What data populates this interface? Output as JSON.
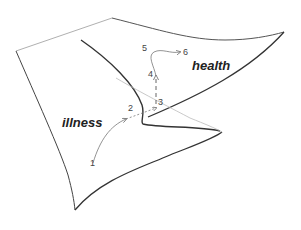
{
  "diagram": {
    "type": "cusp-catastrophe-surface",
    "regions": [
      {
        "id": "illness",
        "label": "illness",
        "x": 62,
        "y": 115
      },
      {
        "id": "health",
        "label": "health",
        "x": 192,
        "y": 58
      }
    ],
    "steps": [
      {
        "label": "1",
        "x": 90,
        "y": 158
      },
      {
        "label": "2",
        "x": 128,
        "y": 103
      },
      {
        "label": "3",
        "x": 157,
        "y": 96
      },
      {
        "label": "4",
        "x": 148,
        "y": 69
      },
      {
        "label": "5",
        "x": 143,
        "y": 43
      },
      {
        "label": "6",
        "x": 182,
        "y": 47
      }
    ],
    "colors": {
      "edge_dark": "#333333",
      "edge_light": "#aaaaaa",
      "trajectory": "#777777",
      "text": "#222222"
    }
  }
}
